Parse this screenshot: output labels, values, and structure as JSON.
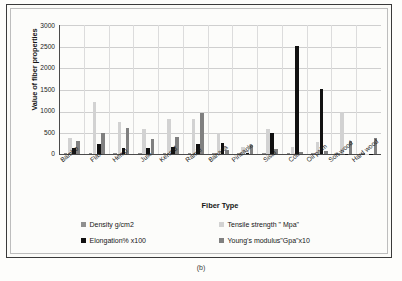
{
  "figure": {
    "caption": "(b)"
  },
  "chart_data": {
    "type": "bar",
    "title": "",
    "xlabel": "Fiber Type",
    "ylabel": "Value of fiber properties",
    "ylim": [
      0,
      3000
    ],
    "ytick_labels": [
      "3000",
      "2500",
      "2000",
      "1500",
      "1000",
      "500",
      "0"
    ],
    "yticks": [
      3000,
      2500,
      2000,
      1500,
      1000,
      500,
      0
    ],
    "grid": true,
    "legend_position": "bottom",
    "categories": [
      "Bambo",
      "Flax",
      "Hemp",
      "Jute",
      "Kennaf",
      "Ramie",
      "Banana",
      "Pineaple",
      "Sisal",
      "Coir",
      "Oil palm",
      "Soft wood",
      "Hard wood"
    ],
    "series": [
      {
        "name": "Density g/cm2",
        "color": "#8f8f8f",
        "values": [
          15,
          15,
          15,
          14,
          12,
          15,
          13,
          15,
          13,
          15,
          15,
          14,
          15
        ]
      },
      {
        "name": "Tensile strength \" Mpa\"",
        "color": "#d2d2d2",
        "values": [
          380,
          1190,
          745,
          585,
          800,
          810,
          490,
          170,
          580,
          160,
          280,
          975,
          10
        ]
      },
      {
        "name": "Elongation% x100",
        "color": "#111111",
        "values": [
          130,
          220,
          150,
          130,
          160,
          240,
          260,
          20,
          490,
          2495,
          1490,
          10,
          10
        ]
      },
      {
        "name": "Young's modulus\"Gpa\"x10",
        "color": "#808080",
        "values": [
          290,
          490,
          590,
          340,
          385,
          935,
          90,
          205,
          105,
          45,
          70,
          290,
          370
        ]
      }
    ]
  }
}
